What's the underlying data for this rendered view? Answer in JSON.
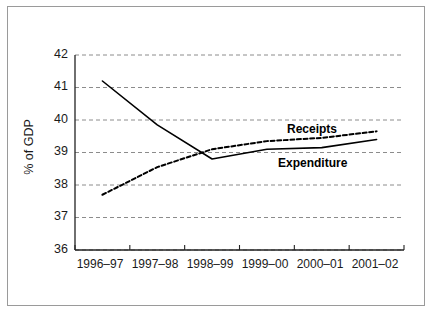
{
  "chart_data": {
    "type": "line",
    "title": "",
    "subtitle": "",
    "xlabel": "",
    "ylabel": "% of GDP",
    "categories": [
      "1996–97",
      "1997–98",
      "1998–99",
      "1999–00",
      "2000–01",
      "2001–02"
    ],
    "ylim": [
      36,
      42
    ],
    "yticks": [
      36,
      37,
      38,
      39,
      40,
      41,
      42
    ],
    "ytick_labels": [
      "36",
      "37",
      "38",
      "39",
      "40",
      "41",
      "42"
    ],
    "grid": "horizontal-dashed",
    "legend_position": "inline-annotations",
    "series": [
      {
        "name": "Expenditure",
        "style": "solid",
        "color": "#000000",
        "values": [
          41.2,
          39.85,
          38.8,
          39.1,
          39.15,
          39.4
        ]
      },
      {
        "name": "Receipts",
        "style": "dashed",
        "color": "#000000",
        "values": [
          37.7,
          38.55,
          39.1,
          39.35,
          39.45,
          39.65
        ]
      }
    ],
    "annotations": [
      {
        "text": "Receipts",
        "series": "Receipts",
        "bold": true
      },
      {
        "text": "Expenditure",
        "series": "Expenditure",
        "bold": true
      }
    ]
  },
  "axis": {
    "y_label": "% of GDP",
    "y_ticks": [
      "42",
      "41",
      "40",
      "39",
      "38",
      "37",
      "36"
    ],
    "x_ticks": [
      "1996–97",
      "1997–98",
      "1998–99",
      "1999–00",
      "2000–01",
      "2001–02"
    ]
  },
  "annotations": {
    "receipts": "Receipts",
    "expenditure": "Expenditure"
  },
  "colors": {
    "line": "#000000",
    "grid": "#8c8c8c",
    "axis": "#222222",
    "frame": "#9a9a9a",
    "background": "#ffffff"
  }
}
